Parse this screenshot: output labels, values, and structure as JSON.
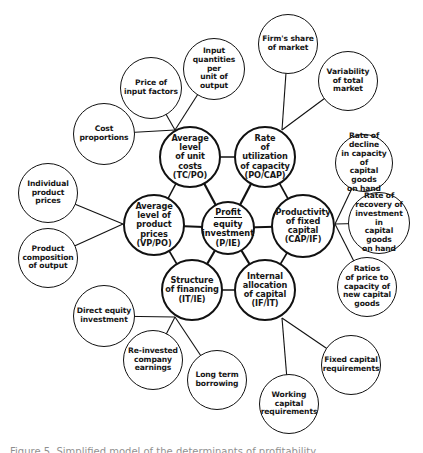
{
  "diagram": {
    "center": {
      "id": "profit-equity-investment",
      "numerator": "Profit",
      "denominator": "equity\ninvestment\n(P/IE)",
      "x": 228,
      "y": 228,
      "r": 27
    },
    "inner": [
      {
        "id": "unit-costs",
        "label": "Average level\nof unit costs\n(TC/PO)",
        "x": 190,
        "y": 157,
        "r": 31,
        "jx": 175,
        "jy": 130
      },
      {
        "id": "capacity-utilization",
        "label": "Rate\nof utilization\nof capacity\n(PO/CAP)",
        "x": 265,
        "y": 157,
        "r": 31,
        "jx": 282,
        "jy": 130
      },
      {
        "id": "product-prices",
        "label": "Average\nlevel of product\nprices\n(VP/PO)",
        "x": 154,
        "y": 225,
        "r": 31,
        "jx": 123,
        "jy": 224
      },
      {
        "id": "fixed-capital-productivity",
        "label": "Productivity\nof fixed capital\n(CAP/IF)",
        "x": 303,
        "y": 226,
        "r": 32,
        "jx": 335,
        "jy": 224
      },
      {
        "id": "financing-structure",
        "label": "Structure\nof financing\n(IT/IE)",
        "x": 192,
        "y": 290,
        "r": 31,
        "jx": 175,
        "jy": 317
      },
      {
        "id": "capital-allocation",
        "label": "Internal\nallocation\nof capital\n(IF/IT)",
        "x": 265,
        "y": 290,
        "r": 31,
        "jx": 282,
        "jy": 318
      }
    ],
    "inner_links": [
      [
        0,
        1
      ],
      [
        1,
        3
      ],
      [
        3,
        5
      ],
      [
        5,
        4
      ],
      [
        4,
        2
      ],
      [
        2,
        0
      ]
    ],
    "outer": [
      {
        "id": "firms-share",
        "parent": 1,
        "label": "Firm's share\nof market",
        "x": 288,
        "y": 44,
        "r": 30
      },
      {
        "id": "market-variability",
        "parent": 1,
        "label": "Variability\nof total market",
        "x": 348,
        "y": 81,
        "r": 30
      },
      {
        "id": "input-quantities",
        "parent": 0,
        "label": "Input\nquantities per\nunit of\noutput",
        "x": 214,
        "y": 69,
        "r": 31
      },
      {
        "id": "input-prices",
        "parent": 0,
        "label": "Price of\ninput factors",
        "x": 151,
        "y": 88,
        "r": 31
      },
      {
        "id": "cost-proportions",
        "parent": 0,
        "label": "Cost\nproportions",
        "x": 104,
        "y": 134,
        "r": 31
      },
      {
        "id": "individual-prices",
        "parent": 2,
        "label": "Individual\nproduct prices",
        "x": 48,
        "y": 193,
        "r": 30
      },
      {
        "id": "product-composition",
        "parent": 2,
        "label": "Product\ncomposition\nof output",
        "x": 48,
        "y": 258,
        "r": 30
      },
      {
        "id": "direct-equity",
        "parent": 4,
        "label": "Direct equity\ninvestment",
        "x": 104,
        "y": 316,
        "r": 31
      },
      {
        "id": "reinvested-earnings",
        "parent": 4,
        "label": "Re-invested\ncompany\nearnings",
        "x": 153,
        "y": 360,
        "r": 30
      },
      {
        "id": "long-term-borrowing",
        "parent": 4,
        "label": "Long term\nborrowing",
        "x": 217,
        "y": 380,
        "r": 30
      },
      {
        "id": "working-capital",
        "parent": 5,
        "label": "Working capital\nrequirements",
        "x": 289,
        "y": 404,
        "r": 30
      },
      {
        "id": "fixed-capital-req",
        "parent": 5,
        "label": "Fixed capital\nrequirements",
        "x": 351,
        "y": 365,
        "r": 30
      },
      {
        "id": "capacity-decline",
        "parent": 3,
        "label": "Rate of decline\nin capacity of\ncapital goods\non hand",
        "x": 364,
        "y": 163,
        "r": 29
      },
      {
        "id": "investment-recovery",
        "parent": 3,
        "label": "Rate of\nrecovery of\ninvestment in\ncapital goods\non hand",
        "x": 379,
        "y": 223,
        "r": 31
      },
      {
        "id": "price-capacity-ratios",
        "parent": 3,
        "label": "Ratios\nof price to\ncapacity of\nnew capital\ngoods",
        "x": 367,
        "y": 287,
        "r": 30
      }
    ],
    "caption": "Figure 5.  Simplified model of the determinants of profitability"
  }
}
